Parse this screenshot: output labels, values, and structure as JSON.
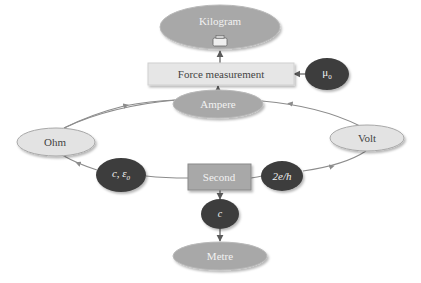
{
  "diagram": {
    "colors": {
      "mid_gray_node": "#a8a8a8",
      "light_gray_node": "#e3e3e3",
      "dark_node": "#3d3d3d",
      "edge": "#8c8c8c",
      "label_on_dark": "#f2f2f2",
      "label_on_light": "#444444"
    },
    "nodes": {
      "kilogram": {
        "label": "Kilogram",
        "shape": "ellipse",
        "style": "mid",
        "icon": "weight-icon"
      },
      "force_measurement": {
        "label": "Force measurement",
        "shape": "rect",
        "style": "light"
      },
      "mu0": {
        "label": "μ",
        "sub": "0",
        "shape": "ellipse",
        "style": "dark"
      },
      "ampere": {
        "label": "Ampere",
        "shape": "ellipse",
        "style": "mid"
      },
      "ohm": {
        "label": "Ohm",
        "shape": "ellipse",
        "style": "light"
      },
      "volt": {
        "label": "Volt",
        "shape": "ellipse",
        "style": "light"
      },
      "c_eps0": {
        "label": "c, ε",
        "sub": "0",
        "shape": "ellipse",
        "style": "dark"
      },
      "second": {
        "label": "Second",
        "shape": "rect",
        "style": "mid"
      },
      "two_e_h": {
        "label": "2e/h",
        "shape": "ellipse",
        "style": "dark"
      },
      "c": {
        "label": "c",
        "shape": "ellipse",
        "style": "dark"
      },
      "metre": {
        "label": "Metre",
        "shape": "ellipse",
        "style": "mid"
      }
    },
    "edges": [
      {
        "from": "force_measurement",
        "to": "kilogram"
      },
      {
        "from": "mu0",
        "to": "force_measurement"
      },
      {
        "from": "ampere",
        "to": "force_measurement"
      },
      {
        "from": "ohm",
        "to": "ampere"
      },
      {
        "from": "volt",
        "to": "ampere"
      },
      {
        "from": "second",
        "to": "c_eps0"
      },
      {
        "from": "c_eps0",
        "to": "ohm"
      },
      {
        "from": "second",
        "to": "two_e_h"
      },
      {
        "from": "two_e_h",
        "to": "volt"
      },
      {
        "from": "second",
        "to": "c"
      },
      {
        "from": "c",
        "to": "metre"
      }
    ]
  }
}
